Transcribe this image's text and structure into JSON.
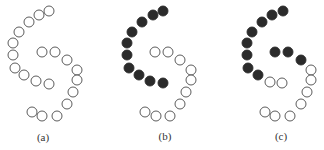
{
  "figure": {
    "colors": {
      "open_fill": "#ffffff",
      "stroke": "#4a4a4a",
      "filled": "#2b2b2b"
    },
    "radius": 5,
    "panels": [
      {
        "label": "(a)",
        "label_pos": [
          43,
          137
        ],
        "circles": [
          {
            "x": 49,
            "y": 11,
            "filled": false
          },
          {
            "x": 39,
            "y": 15,
            "filled": false
          },
          {
            "x": 29,
            "y": 22,
            "filled": false
          },
          {
            "x": 19,
            "y": 32,
            "filled": false
          },
          {
            "x": 13,
            "y": 43,
            "filled": false
          },
          {
            "x": 13,
            "y": 55,
            "filled": false
          },
          {
            "x": 15,
            "y": 68,
            "filled": false
          },
          {
            "x": 24,
            "y": 75,
            "filled": false
          },
          {
            "x": 36,
            "y": 81,
            "filled": false
          },
          {
            "x": 49,
            "y": 84,
            "filled": false
          },
          {
            "x": 42,
            "y": 52,
            "filled": false
          },
          {
            "x": 55,
            "y": 52,
            "filled": false
          },
          {
            "x": 67,
            "y": 60,
            "filled": false
          },
          {
            "x": 77,
            "y": 70,
            "filled": false
          },
          {
            "x": 77,
            "y": 80,
            "filled": false
          },
          {
            "x": 73,
            "y": 92,
            "filled": false
          },
          {
            "x": 67,
            "y": 104,
            "filled": false
          },
          {
            "x": 57,
            "y": 116,
            "filled": false
          },
          {
            "x": 42,
            "y": 116,
            "filled": false
          },
          {
            "x": 32,
            "y": 112,
            "filled": false
          }
        ]
      },
      {
        "label": "(b)",
        "label_pos": [
          165,
          136
        ],
        "circles": [
          {
            "x": 163,
            "y": 11,
            "filled": true
          },
          {
            "x": 153,
            "y": 15,
            "filled": true
          },
          {
            "x": 142,
            "y": 22,
            "filled": true
          },
          {
            "x": 132,
            "y": 32,
            "filled": true
          },
          {
            "x": 127,
            "y": 43,
            "filled": true
          },
          {
            "x": 127,
            "y": 55,
            "filled": true
          },
          {
            "x": 129,
            "y": 68,
            "filled": true
          },
          {
            "x": 139,
            "y": 75,
            "filled": true
          },
          {
            "x": 150,
            "y": 81,
            "filled": true
          },
          {
            "x": 163,
            "y": 83,
            "filled": true
          },
          {
            "x": 155,
            "y": 52,
            "filled": false
          },
          {
            "x": 168,
            "y": 52,
            "filled": false
          },
          {
            "x": 180,
            "y": 60,
            "filled": false
          },
          {
            "x": 191,
            "y": 70,
            "filled": false
          },
          {
            "x": 191,
            "y": 80,
            "filled": false
          },
          {
            "x": 186,
            "y": 92,
            "filled": false
          },
          {
            "x": 180,
            "y": 104,
            "filled": false
          },
          {
            "x": 170,
            "y": 116,
            "filled": false
          },
          {
            "x": 156,
            "y": 116,
            "filled": false
          },
          {
            "x": 145,
            "y": 112,
            "filled": false
          }
        ]
      },
      {
        "label": "(c)",
        "label_pos": [
          281,
          136
        ],
        "circles": [
          {
            "x": 283,
            "y": 11,
            "filled": true
          },
          {
            "x": 272,
            "y": 15,
            "filled": true
          },
          {
            "x": 262,
            "y": 22,
            "filled": true
          },
          {
            "x": 252,
            "y": 32,
            "filled": true
          },
          {
            "x": 247,
            "y": 43,
            "filled": true
          },
          {
            "x": 247,
            "y": 55,
            "filled": true
          },
          {
            "x": 248,
            "y": 68,
            "filled": true
          },
          {
            "x": 258,
            "y": 75,
            "filled": true
          },
          {
            "x": 275,
            "y": 52,
            "filled": true
          },
          {
            "x": 288,
            "y": 52,
            "filled": true
          },
          {
            "x": 301,
            "y": 60,
            "filled": true
          },
          {
            "x": 270,
            "y": 82,
            "filled": false
          },
          {
            "x": 282,
            "y": 83,
            "filled": false
          },
          {
            "x": 311,
            "y": 70,
            "filled": false
          },
          {
            "x": 311,
            "y": 80,
            "filled": false
          },
          {
            "x": 307,
            "y": 92,
            "filled": false
          },
          {
            "x": 301,
            "y": 104,
            "filled": false
          },
          {
            "x": 290,
            "y": 116,
            "filled": false
          },
          {
            "x": 275,
            "y": 116,
            "filled": false
          },
          {
            "x": 265,
            "y": 112,
            "filled": false
          }
        ]
      }
    ]
  }
}
